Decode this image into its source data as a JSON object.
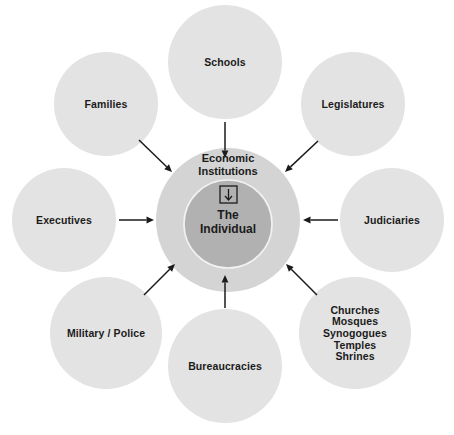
{
  "diagram": {
    "type": "hub-and-spoke concept diagram",
    "background_color": "#ffffff",
    "center": {
      "ring_label_line1": "Economic",
      "ring_label_line2": "Institutions",
      "ring_color": "#d4d4d4",
      "core_label_line1": "The",
      "core_label_line2": "Individual",
      "core_color": "#b1b1b1",
      "glyph_icon": "boxed-down-arrow-icon"
    },
    "satellite_color": "#e3e3e3",
    "arrow_color": "#1b1b1b",
    "satellites": [
      {
        "id": "schools",
        "lines": [
          "Schools"
        ],
        "cx": 225,
        "cy": 62,
        "r": 57,
        "arrow_from": [
          225,
          122
        ],
        "arrow_to": [
          225,
          158
        ]
      },
      {
        "id": "legislatures",
        "lines": [
          "Legislatures"
        ],
        "cx": 353,
        "cy": 104,
        "r": 52,
        "arrow_from": [
          318,
          141
        ],
        "arrow_to": [
          285,
          172
        ]
      },
      {
        "id": "judiciaries",
        "lines": [
          "Judiciaries"
        ],
        "cx": 392,
        "cy": 220,
        "r": 52,
        "arrow_from": [
          338,
          220
        ],
        "arrow_to": [
          303,
          220
        ]
      },
      {
        "id": "religious-institutions",
        "lines": [
          "Churches",
          "Mosques",
          "Synogogues",
          "Temples",
          "Shrines"
        ],
        "cx": 355,
        "cy": 333,
        "r": 56,
        "arrow_from": [
          317,
          295
        ],
        "arrow_to": [
          286,
          264
        ]
      },
      {
        "id": "bureaucracies",
        "lines": [
          "Bureaucracies"
        ],
        "cx": 225,
        "cy": 366,
        "r": 57,
        "arrow_from": [
          225,
          308
        ],
        "arrow_to": [
          225,
          275
        ]
      },
      {
        "id": "military-police",
        "lines": [
          "Military / Police"
        ],
        "cx": 106,
        "cy": 333,
        "r": 56,
        "arrow_from": [
          144,
          295
        ],
        "arrow_to": [
          175,
          264
        ]
      },
      {
        "id": "executives",
        "lines": [
          "Executives"
        ],
        "cx": 64,
        "cy": 220,
        "r": 52,
        "arrow_from": [
          119,
          220
        ],
        "arrow_to": [
          154,
          220
        ]
      },
      {
        "id": "families",
        "lines": [
          "Families"
        ],
        "cx": 106,
        "cy": 104,
        "r": 52,
        "arrow_from": [
          139,
          140
        ],
        "arrow_to": [
          172,
          172
        ]
      }
    ]
  }
}
